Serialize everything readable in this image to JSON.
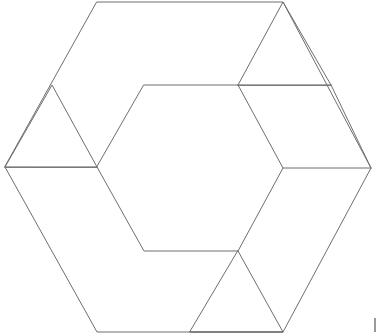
{
  "figure": {
    "type": "line-diagram",
    "canvas": {
      "width": 377,
      "height": 335,
      "background": "#ffffff"
    },
    "stroke": {
      "color": "#6e6e6e",
      "width": 1
    },
    "outer_hexagon": {
      "name": "outer-hexagon",
      "points": "97,2 283,2 371,168 283,332 97,332 5,167",
      "vertices": [
        {
          "label": "top-left",
          "x": 97,
          "y": 2
        },
        {
          "label": "top-right",
          "x": 283,
          "y": 2
        },
        {
          "label": "right",
          "x": 371,
          "y": 168
        },
        {
          "label": "bottom-right",
          "x": 283,
          "y": 332
        },
        {
          "label": "bottom-left",
          "x": 97,
          "y": 332
        },
        {
          "label": "left",
          "x": 5,
          "y": 167
        }
      ]
    },
    "inner_hexagon": {
      "name": "inner-hexagon",
      "points": "144,85 238,85 283,168 238,251 144,251 97,167",
      "vertices": [
        {
          "label": "top-left",
          "x": 144,
          "y": 85
        },
        {
          "label": "top-right",
          "x": 238,
          "y": 85
        },
        {
          "label": "right",
          "x": 283,
          "y": 168
        },
        {
          "label": "bottom-right",
          "x": 238,
          "y": 251
        },
        {
          "label": "bottom-left",
          "x": 144,
          "y": 251
        },
        {
          "label": "left",
          "x": 97,
          "y": 167
        }
      ]
    },
    "triangles": [
      {
        "name": "upper-left-triangle",
        "points": "5,167 52,85 97,167",
        "orientation": "point-up"
      },
      {
        "name": "upper-right-triangle",
        "points": "238,85 283,2 331,85",
        "orientation": "point-up"
      },
      {
        "name": "lower-bottom-triangle",
        "points": "238,251 283,332 190,332",
        "orientation": "point-up-inverted"
      }
    ],
    "chords": [
      {
        "name": "left-horizontal-chord",
        "x1": 5,
        "y1": 167,
        "x2": 97,
        "y2": 167
      },
      {
        "name": "right-upper-horizontal-chord",
        "x1": 238,
        "y1": 85,
        "x2": 331,
        "y2": 85
      },
      {
        "name": "right-horizontal-chord",
        "x1": 283,
        "y1": 168,
        "x2": 371,
        "y2": 168
      },
      {
        "name": "bottom-horizontal-chord",
        "x1": 190,
        "y1": 332,
        "x2": 283,
        "y2": 332
      }
    ],
    "connector_segments": [
      {
        "name": "upper-right-slant-to-right-vertex",
        "x1": 331,
        "y1": 85,
        "x2": 371,
        "y2": 168
      },
      {
        "name": "bottom-triangle-left-slant",
        "x1": 238,
        "y1": 251,
        "x2": 190,
        "y2": 332
      },
      {
        "name": "bottom-triangle-right-slant",
        "x1": 238,
        "y1": 251,
        "x2": 283,
        "y2": 332
      },
      {
        "name": "upper-left-triangle-left-slant",
        "x1": 5,
        "y1": 167,
        "x2": 52,
        "y2": 85
      },
      {
        "name": "upper-left-triangle-right-slant",
        "x1": 52,
        "y1": 85,
        "x2": 97,
        "y2": 167
      },
      {
        "name": "upper-right-triangle-left-slant",
        "x1": 238,
        "y1": 85,
        "x2": 283,
        "y2": 2
      },
      {
        "name": "upper-right-triangle-right-slant",
        "x1": 283,
        "y1": 2,
        "x2": 331,
        "y2": 85
      }
    ],
    "edge_mark": {
      "name": "right-margin-tick",
      "x": 374,
      "y": 318,
      "width": 2,
      "height": 14,
      "color": "#9a9a9a"
    }
  }
}
